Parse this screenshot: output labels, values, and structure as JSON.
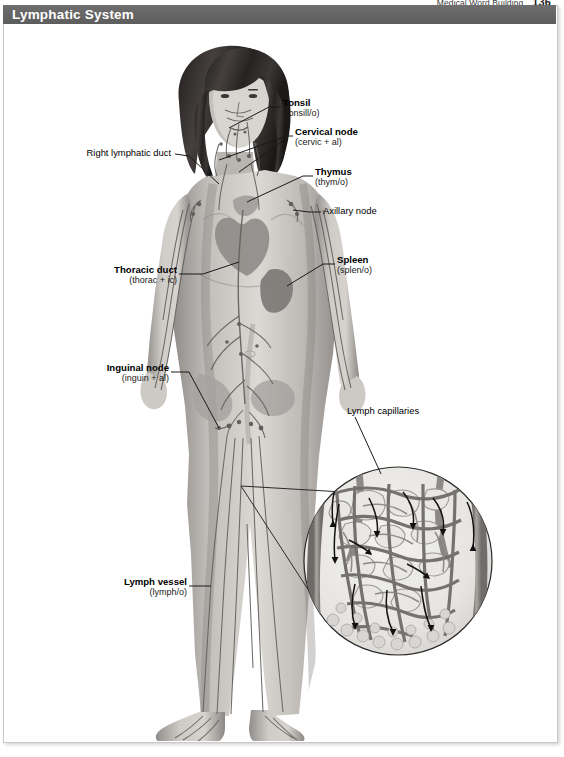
{
  "running_head": {
    "text": "Medical Word Building",
    "page_number": "136"
  },
  "banner": {
    "title": "Lymphatic System",
    "bg_color": "#636363",
    "text_color": "#ffffff"
  },
  "figure": {
    "style": "grayscale medical illustration",
    "inset": {
      "name": "lymph-capillary-inset",
      "shape": "circle",
      "description": "magnified view of a lymph capillary bed within tissue, with directional flow arrows"
    }
  },
  "labels": [
    {
      "id": "tonsil",
      "title": "Tonsil",
      "wordpart": "(tonsill/o)",
      "bold": true,
      "align": "left"
    },
    {
      "id": "cervical-node",
      "title": "Cervical node",
      "wordpart": "(cervic + al)",
      "bold": true,
      "align": "left"
    },
    {
      "id": "thymus",
      "title": "Thymus",
      "wordpart": "(thym/o)",
      "bold": true,
      "align": "left"
    },
    {
      "id": "axillary-node",
      "title": "Axillary node",
      "wordpart": "",
      "bold": false,
      "align": "left"
    },
    {
      "id": "spleen",
      "title": "Spleen",
      "wordpart": "(splen/o)",
      "bold": true,
      "align": "left"
    },
    {
      "id": "right-lymphatic-duct",
      "title": "Right lymphatic duct",
      "wordpart": "",
      "bold": false,
      "align": "right"
    },
    {
      "id": "thoracic-duct",
      "title": "Thoracic duct",
      "wordpart": "(thorac + ic)",
      "bold": true,
      "align": "right"
    },
    {
      "id": "inguinal-node",
      "title": "Inguinal node",
      "wordpart": "(inguin + al)",
      "bold": true,
      "align": "right"
    },
    {
      "id": "lymph-vessel",
      "title": "Lymph vessel",
      "wordpart": "(lymph/o)",
      "bold": true,
      "align": "right"
    },
    {
      "id": "lymph-capillaries",
      "title": "Lymph capillaries",
      "wordpart": "",
      "bold": false,
      "align": "left"
    }
  ],
  "colors": {
    "banner": "#636363",
    "frame_border": "#c9c9c9",
    "leader_line": "#1a1a1a",
    "skin_light": "#d9d6d2",
    "skin_mid": "#b3afab",
    "skin_dark": "#8d8a87",
    "hair": "#2f2c2b",
    "vessel": "#6f6b68",
    "page_background": "#ffffff"
  }
}
